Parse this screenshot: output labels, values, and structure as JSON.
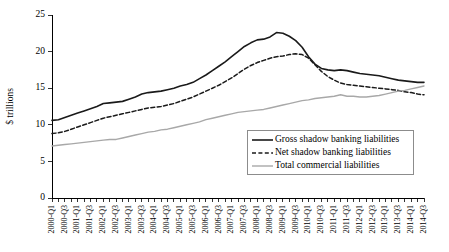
{
  "chart_data": {
    "type": "line",
    "title": "",
    "xlabel": "",
    "ylabel": "$ trillions",
    "ylim": [
      0,
      25
    ],
    "yticks": [
      0,
      5,
      10,
      15,
      20,
      25
    ],
    "ytick_labels": [
      "0",
      "5",
      "10",
      "15",
      "20",
      "25"
    ],
    "grid": false,
    "legend_position": "lower-right",
    "x": [
      "2000-Q1",
      "2000-Q2",
      "2000-Q3",
      "2000-Q4",
      "2001-Q1",
      "2001-Q2",
      "2001-Q3",
      "2001-Q4",
      "2002-Q1",
      "2002-Q2",
      "2002-Q3",
      "2002-Q4",
      "2003-Q1",
      "2003-Q2",
      "2003-Q3",
      "2003-Q4",
      "2004-Q1",
      "2004-Q2",
      "2004-Q3",
      "2004-Q4",
      "2005-Q1",
      "2005-Q2",
      "2005-Q3",
      "2005-Q4",
      "2006-Q1",
      "2006-Q2",
      "2006-Q3",
      "2006-Q4",
      "2007-Q1",
      "2007-Q2",
      "2007-Q3",
      "2007-Q4",
      "2008-Q1",
      "2008-Q2",
      "2008-Q3",
      "2008-Q4",
      "2009-Q1",
      "2009-Q2",
      "2009-Q3",
      "2009-Q4",
      "2010-Q1",
      "2010-Q2",
      "2010-Q3",
      "2010-Q4",
      "2011-Q1",
      "2011-Q2",
      "2011-Q3",
      "2011-Q4",
      "2012-Q1",
      "2012-Q2",
      "2012-Q3",
      "2012-Q4",
      "2013-Q1",
      "2013-Q2",
      "2013-Q3",
      "2013-Q4",
      "2014-Q1",
      "2014-Q2",
      "2014-Q3"
    ],
    "xtick_labels": [
      "2000-Q1",
      "",
      "2000-Q3",
      "",
      "2001-Q1",
      "",
      "2001-Q3",
      "",
      "2002-Q1",
      "",
      "2002-Q3",
      "",
      "2003-Q1",
      "",
      "2003-Q3",
      "",
      "2004-Q1",
      "",
      "2004-Q3",
      "",
      "2005-Q1",
      "",
      "2005-Q3",
      "",
      "2006-Q1",
      "",
      "2006-Q3",
      "",
      "2007-Q1",
      "",
      "2007-Q3",
      "",
      "2008-Q1",
      "",
      "2008-Q3",
      "",
      "2009-Q1",
      "",
      "2009-Q3",
      "",
      "2010-Q1",
      "",
      "2010-Q3",
      "",
      "2011-Q1",
      "",
      "2011-Q3",
      "",
      "2012-Q1",
      "",
      "2012-Q3",
      "",
      "2013-Q1",
      "",
      "2013-Q3",
      "",
      "2014-Q1",
      "",
      "2014-Q3"
    ],
    "series": [
      {
        "name": "Gross shadow banking liabilities",
        "color": "#1a1a1a",
        "style": "solid",
        "width": 1.6,
        "values": [
          10.6,
          10.7,
          11.0,
          11.3,
          11.6,
          11.9,
          12.2,
          12.5,
          12.9,
          13.0,
          13.1,
          13.2,
          13.5,
          13.8,
          14.2,
          14.4,
          14.5,
          14.6,
          14.8,
          15.0,
          15.3,
          15.5,
          15.8,
          16.3,
          16.8,
          17.4,
          18.0,
          18.6,
          19.3,
          20.0,
          20.7,
          21.2,
          21.6,
          21.7,
          22.0,
          22.6,
          22.5,
          22.1,
          21.5,
          20.6,
          19.3,
          18.3,
          17.7,
          17.5,
          17.4,
          17.5,
          17.4,
          17.2,
          17.0,
          16.9,
          16.8,
          16.7,
          16.5,
          16.3,
          16.1,
          16.0,
          15.9,
          15.8,
          15.8
        ]
      },
      {
        "name": "Net shadow banking liabilities",
        "color": "#1a1a1a",
        "style": "dashed",
        "width": 1.5,
        "values": [
          8.8,
          8.9,
          9.1,
          9.4,
          9.7,
          10.0,
          10.3,
          10.6,
          10.9,
          11.1,
          11.3,
          11.5,
          11.7,
          11.9,
          12.1,
          12.3,
          12.4,
          12.5,
          12.7,
          12.9,
          13.2,
          13.5,
          13.8,
          14.2,
          14.6,
          15.0,
          15.4,
          15.9,
          16.4,
          17.0,
          17.6,
          18.1,
          18.5,
          18.8,
          19.1,
          19.3,
          19.4,
          19.6,
          19.7,
          19.6,
          19.1,
          18.2,
          17.3,
          16.6,
          16.1,
          15.7,
          15.5,
          15.4,
          15.3,
          15.2,
          15.1,
          15.0,
          14.9,
          14.8,
          14.7,
          14.5,
          14.4,
          14.2,
          14.1
        ]
      },
      {
        "name": "Total commercial liabilities",
        "color": "#a8a8a8",
        "style": "solid",
        "width": 1.4,
        "values": [
          7.1,
          7.2,
          7.3,
          7.4,
          7.5,
          7.6,
          7.7,
          7.8,
          7.9,
          8.0,
          8.0,
          8.2,
          8.4,
          8.6,
          8.8,
          9.0,
          9.1,
          9.3,
          9.4,
          9.6,
          9.8,
          10.0,
          10.2,
          10.4,
          10.7,
          10.9,
          11.1,
          11.3,
          11.5,
          11.7,
          11.8,
          11.9,
          12.0,
          12.1,
          12.3,
          12.5,
          12.7,
          12.9,
          13.1,
          13.3,
          13.4,
          13.6,
          13.7,
          13.8,
          13.9,
          14.1,
          13.9,
          13.9,
          13.8,
          13.8,
          13.9,
          14.0,
          14.2,
          14.4,
          14.6,
          14.7,
          14.9,
          15.1,
          15.3
        ]
      }
    ]
  },
  "axes": {
    "y_title": "$ trillions"
  }
}
